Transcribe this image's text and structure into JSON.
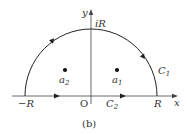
{
  "figure": {
    "caption": "(b)",
    "axes": {
      "x_label": "x",
      "y_label": "y",
      "origin_label": "O"
    },
    "points": {
      "neg_R": "−R",
      "pos_R": "R",
      "iR": "iR"
    },
    "curves": {
      "C1": {
        "name": "C",
        "sub": "1"
      },
      "C2": {
        "name": "C",
        "sub": "2"
      }
    },
    "poles": [
      {
        "name": "a",
        "sub": "2"
      },
      {
        "name": "a",
        "sub": "1"
      }
    ],
    "colors": {
      "stroke": "#222222",
      "text": "#333333"
    }
  }
}
